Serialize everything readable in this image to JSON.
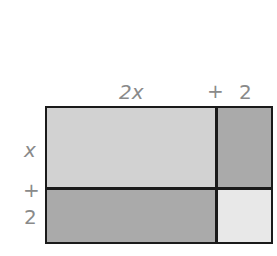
{
  "diagram": {
    "top_labels": {
      "term1": "2x",
      "plus": "+",
      "term2": "2"
    },
    "side_labels": {
      "term1": "x",
      "plus": "+",
      "term2": "2"
    },
    "regions": [
      {
        "name": "2x-by-x",
        "color": "#d2d2d2"
      },
      {
        "name": "2-by-x",
        "color": "#aaaaaa"
      },
      {
        "name": "2x-by-2",
        "color": "#aaaaaa"
      },
      {
        "name": "2-by-2",
        "color": "#e8e8e8"
      }
    ],
    "border_color": "#1a1a1a",
    "label_color": "#8a8a8a"
  }
}
